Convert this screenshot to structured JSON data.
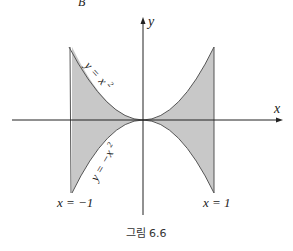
{
  "figure": {
    "caption": "그림 6.6",
    "top_partial_text": "B",
    "axes": {
      "x_label": "x",
      "y_label": "y"
    },
    "curves": [
      {
        "name": "upper",
        "equation_label": "y = x²",
        "label_y": "y",
        "label_eq": "=",
        "label_x": "x",
        "label_exp": "2"
      },
      {
        "name": "lower",
        "equation_label": "y = −x²",
        "label_y": "y",
        "label_eq": "=",
        "label_x": "−x",
        "label_exp": "2"
      }
    ],
    "boundaries": [
      {
        "name": "left",
        "label": "x = −1"
      },
      {
        "name": "right",
        "label": "x = 1"
      }
    ],
    "colors": {
      "fill": "#c8c8c8",
      "stroke": "#555555",
      "axis": "#222222"
    }
  }
}
